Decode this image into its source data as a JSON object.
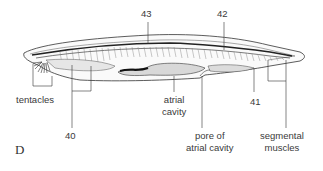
{
  "figure": {
    "panel_label": "D",
    "labels": {
      "n43": "43",
      "n42": "42",
      "n41": "41",
      "n40": "40",
      "tentacles": "tentacles",
      "atrial_cavity_1": "atrial",
      "atrial_cavity_2": "cavity",
      "pore_1": "pore of",
      "pore_2": "atrial cavity",
      "segmental_1": "segmental",
      "segmental_2": "muscles"
    },
    "colors": {
      "line": "#333333",
      "body_fill": "#f4f4f4",
      "dark": "#222222"
    }
  }
}
